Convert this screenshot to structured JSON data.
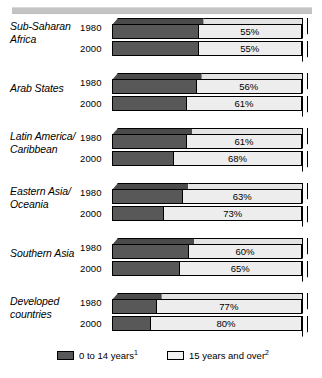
{
  "chart_data": {
    "type": "bar",
    "orientation": "horizontal",
    "stacked": true,
    "title": "",
    "subtitle": "",
    "xlabel": "",
    "ylabel": "",
    "xlim": [
      0,
      100
    ],
    "grid": false,
    "legend_position": "bottom",
    "categories": [
      "Sub-Saharan Africa",
      "Arab States",
      "Latin America/ Caribbean",
      "Eastern Asia/ Oceania",
      "Southern Asia",
      "Developed countries"
    ],
    "subcategories": [
      "1980",
      "2000"
    ],
    "series": [
      {
        "name": "0 to 14 years",
        "footnote": "1",
        "color": "#585858",
        "values": [
          [
            45,
            45
          ],
          [
            44,
            39
          ],
          [
            39,
            32
          ],
          [
            37,
            27
          ],
          [
            40,
            35
          ],
          [
            23,
            20
          ]
        ]
      },
      {
        "name": "15 years and over",
        "footnote": "2",
        "color": "#ededed",
        "values": [
          [
            55,
            55
          ],
          [
            56,
            61
          ],
          [
            61,
            68
          ],
          [
            63,
            73
          ],
          [
            60,
            65
          ],
          [
            77,
            80
          ]
        ]
      }
    ],
    "data_labels": [
      {
        "category": "Sub-Saharan Africa",
        "rows": [
          {
            "year": "1980",
            "dark_pct": 45,
            "light_pct": 55,
            "label": "55%"
          },
          {
            "year": "2000",
            "dark_pct": 45,
            "light_pct": 55,
            "label": "55%"
          }
        ]
      },
      {
        "category": "Arab States",
        "rows": [
          {
            "year": "1980",
            "dark_pct": 44,
            "light_pct": 56,
            "label": "56%"
          },
          {
            "year": "2000",
            "dark_pct": 39,
            "light_pct": 61,
            "label": "61%"
          }
        ]
      },
      {
        "category": "Latin America/ Caribbean",
        "rows": [
          {
            "year": "1980",
            "dark_pct": 39,
            "light_pct": 61,
            "label": "61%"
          },
          {
            "year": "2000",
            "dark_pct": 32,
            "light_pct": 68,
            "label": "68%"
          }
        ]
      },
      {
        "category": "Eastern Asia/ Oceania",
        "rows": [
          {
            "year": "1980",
            "dark_pct": 37,
            "light_pct": 63,
            "label": "63%"
          },
          {
            "year": "2000",
            "dark_pct": 27,
            "light_pct": 73,
            "label": "73%"
          }
        ]
      },
      {
        "category": "Southern Asia",
        "rows": [
          {
            "year": "1980",
            "dark_pct": 40,
            "light_pct": 60,
            "label": "60%"
          },
          {
            "year": "2000",
            "dark_pct": 35,
            "light_pct": 65,
            "label": "65%"
          }
        ]
      },
      {
        "category": "Developed countries",
        "rows": [
          {
            "year": "1980",
            "dark_pct": 23,
            "light_pct": 77,
            "label": "77%"
          },
          {
            "year": "2000",
            "dark_pct": 20,
            "light_pct": 80,
            "label": "80%"
          }
        ]
      }
    ]
  },
  "groups": [
    {
      "label_line1": "Sub-Saharan",
      "label_line2": "Africa",
      "rows": [
        {
          "year": "1980",
          "dark": 45,
          "value": "55%"
        },
        {
          "year": "2000",
          "dark": 45,
          "value": "55%"
        }
      ]
    },
    {
      "label_line1": "Arab States",
      "label_line2": "",
      "rows": [
        {
          "year": "1980",
          "dark": 44,
          "value": "56%"
        },
        {
          "year": "2000",
          "dark": 39,
          "value": "61%"
        }
      ]
    },
    {
      "label_line1": "Latin America/",
      "label_line2": "Caribbean",
      "rows": [
        {
          "year": "1980",
          "dark": 39,
          "value": "61%"
        },
        {
          "year": "2000",
          "dark": 32,
          "value": "68%"
        }
      ]
    },
    {
      "label_line1": "Eastern Asia/",
      "label_line2": "Oceania",
      "rows": [
        {
          "year": "1980",
          "dark": 37,
          "value": "63%"
        },
        {
          "year": "2000",
          "dark": 27,
          "value": "73%"
        }
      ]
    },
    {
      "label_line1": "Southern Asia",
      "label_line2": "",
      "rows": [
        {
          "year": "1980",
          "dark": 40,
          "value": "60%"
        },
        {
          "year": "2000",
          "dark": 35,
          "value": "65%"
        }
      ]
    },
    {
      "label_line1": "Developed",
      "label_line2": "countries",
      "rows": [
        {
          "year": "1980",
          "dark": 23,
          "value": "77%"
        },
        {
          "year": "2000",
          "dark": 20,
          "value": "80%"
        }
      ]
    }
  ],
  "legend": {
    "items": [
      {
        "text": "0 to 14 years",
        "footnote": "1",
        "color": "#585858"
      },
      {
        "text": "15 years and over",
        "footnote": "2",
        "color": "#ededed"
      }
    ]
  },
  "colors": {
    "dark_segment": "#585858",
    "light_segment": "#ededed",
    "top_rule": "#c4c4c4",
    "outline": "#000000",
    "background": "#ffffff"
  }
}
